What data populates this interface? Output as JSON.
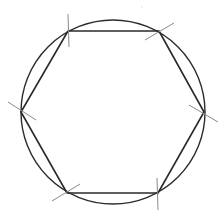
{
  "diagram": {
    "width": 223,
    "height": 217,
    "colors": {
      "background": "#ffffff",
      "circle": "#2b2b2b",
      "hexagon": "#2b2b2b",
      "arc_marks": "#8a8a8a",
      "speck": "#c8c8c8"
    },
    "circle": {
      "cx": 113,
      "cy": 112,
      "r": 92
    },
    "hexagon_vertices": [
      {
        "name": "top-left",
        "x": 68,
        "y": 31
      },
      {
        "name": "top-right",
        "x": 159,
        "y": 31
      },
      {
        "name": "right",
        "x": 204,
        "y": 112
      },
      {
        "name": "bottom-right",
        "x": 158,
        "y": 193
      },
      {
        "name": "bottom-left",
        "x": 67,
        "y": 193
      },
      {
        "name": "left",
        "x": 21,
        "y": 112
      }
    ],
    "arc_marks": [
      {
        "vertex": "top-left",
        "x1": 68,
        "y1": 14,
        "x2": 69,
        "y2": 47
      },
      {
        "vertex": "top-right",
        "x1": 145,
        "y1": 40,
        "x2": 174,
        "y2": 23
      },
      {
        "vertex": "right",
        "x1": 189,
        "y1": 105,
        "x2": 218,
        "y2": 122
      },
      {
        "vertex": "left",
        "x1": 8,
        "y1": 102,
        "x2": 36,
        "y2": 120
      },
      {
        "vertex": "bottom-left",
        "x1": 52,
        "y1": 201,
        "x2": 80,
        "y2": 184
      },
      {
        "vertex": "bottom-right",
        "x1": 157,
        "y1": 178,
        "x2": 158,
        "y2": 210
      }
    ],
    "speck": {
      "x": 142,
      "y": 7
    }
  }
}
